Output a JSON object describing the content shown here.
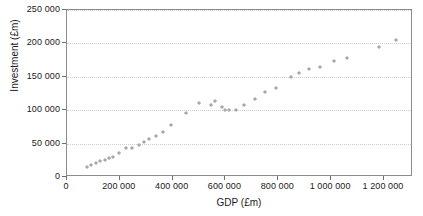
{
  "chart_data": {
    "type": "scatter",
    "title": "",
    "xlabel": "GDP (£m)",
    "ylabel": "Investment (£m)",
    "xlim": [
      0,
      1310000
    ],
    "ylim": [
      0,
      250000
    ],
    "grid": true,
    "legend": null,
    "marker": {
      "shape": "diamond",
      "color": "#a8a8a8",
      "size_px": 3
    },
    "frame_color": "#8c8c8c",
    "gridline_color": "#cfcfcf",
    "xticks": [
      0,
      200000,
      400000,
      600000,
      800000,
      1000000,
      1200000
    ],
    "xtick_labels": [
      "0",
      "200 000",
      "400 000",
      "600 000",
      "800 000",
      "1 000 000",
      "1 200 000"
    ],
    "yticks": [
      0,
      50000,
      100000,
      150000,
      200000,
      250000
    ],
    "ytick_labels": [
      "0",
      "50 000",
      "100 000",
      "150 000",
      "200 000",
      "250 000"
    ],
    "series": [
      {
        "name": "Investment vs GDP",
        "points": [
          [
            75000,
            14500
          ],
          [
            92000,
            18500
          ],
          [
            108000,
            21000
          ],
          [
            125000,
            23500
          ],
          [
            142000,
            25500
          ],
          [
            158000,
            28000
          ],
          [
            176000,
            30500
          ],
          [
            196000,
            36500
          ],
          [
            222000,
            43000
          ],
          [
            246000,
            43500
          ],
          [
            272000,
            47500
          ],
          [
            292000,
            52000
          ],
          [
            312000,
            57500
          ],
          [
            338000,
            62000
          ],
          [
            364000,
            67000
          ],
          [
            392000,
            78000
          ],
          [
            450000,
            95500
          ],
          [
            500000,
            111000
          ],
          [
            545000,
            108000
          ],
          [
            560000,
            114000
          ],
          [
            588000,
            105000
          ],
          [
            600000,
            101000
          ],
          [
            612000,
            100000
          ],
          [
            640000,
            101000
          ],
          [
            672000,
            108000
          ],
          [
            710000,
            117500
          ],
          [
            750000,
            126500
          ],
          [
            790000,
            133000
          ],
          [
            848000,
            150000
          ],
          [
            878000,
            156000
          ],
          [
            918000,
            161000
          ],
          [
            958000,
            164500
          ],
          [
            1010000,
            173000
          ],
          [
            1060000,
            178500
          ],
          [
            1180000,
            195000
          ],
          [
            1245000,
            205500
          ]
        ]
      }
    ]
  }
}
